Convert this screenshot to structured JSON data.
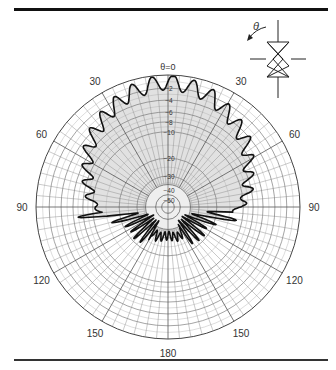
{
  "chart_data": {
    "type": "polar",
    "title": "",
    "angle_label": "θ=0",
    "angle_units": "degrees",
    "angle_ticks": [
      {
        "angle": 0,
        "label": ""
      },
      {
        "angle": 30,
        "label": "30"
      },
      {
        "angle": 60,
        "label": "60"
      },
      {
        "angle": 90,
        "label": "90"
      },
      {
        "angle": 120,
        "label": "120"
      },
      {
        "angle": 150,
        "label": "150"
      },
      {
        "angle": 180,
        "label": "180"
      },
      {
        "angle": -150,
        "label": "150"
      },
      {
        "angle": -120,
        "label": "120"
      },
      {
        "angle": -90,
        "label": "90"
      },
      {
        "angle": -60,
        "label": "60"
      },
      {
        "angle": -30,
        "label": "30"
      }
    ],
    "radial_units": "dB",
    "radial_ticks": [
      "-2",
      "-4",
      "-6",
      "-8",
      "-10",
      "-20",
      "-30",
      "-40",
      "-50"
    ],
    "radial_tick_fraction": [
      0.9,
      0.81,
      0.72,
      0.645,
      0.57,
      0.37,
      0.235,
      0.13,
      0.055
    ],
    "outer_ring_db": 0,
    "grid": true,
    "angular_grid_step_deg": 5,
    "series": [
      {
        "name": "radiation pattern",
        "description": "Main lobe toward θ=0, ripple ~2-4 dB; pattern drops steeply near ±100° with deep nulls; back lobes (θ 100–180) below about -30 dB",
        "angles_deg": [
          0,
          10,
          20,
          30,
          40,
          50,
          60,
          70,
          80,
          90,
          95,
          100,
          105,
          110,
          120,
          130,
          140,
          150,
          160,
          170,
          180
        ],
        "level_db": [
          -1,
          -1.5,
          -2,
          -3,
          -4,
          -5,
          -6.5,
          -8,
          -9,
          -11,
          -14,
          -20,
          -25,
          -28,
          -32,
          -30,
          -31,
          -32,
          -30,
          -31,
          -32
        ]
      }
    ],
    "legend": null
  },
  "inset": {
    "angle_symbol": "θ",
    "icon": "helical-antenna-icon"
  }
}
